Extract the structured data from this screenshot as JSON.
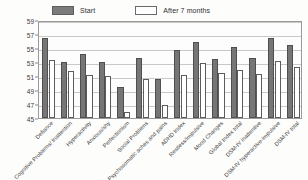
{
  "legend": {
    "position": "top-left",
    "items": [
      {
        "label": "Start",
        "swatch": "start",
        "color": "#767676"
      },
      {
        "label": "After 7 months",
        "swatch": "after",
        "color": "#ffffff"
      }
    ]
  },
  "chart_data": {
    "type": "bar",
    "title": "",
    "subtitle": "",
    "xlabel": "",
    "ylabel": "",
    "ylim": [
      45,
      59
    ],
    "yticks": [
      45,
      47,
      49,
      51,
      53,
      55,
      57,
      59
    ],
    "grid": true,
    "legend_position": "top-left",
    "categories": [
      "Defiance",
      "Cognitive Problems/ Inattention",
      "Hyperactivity",
      "Anxious/shy",
      "Perfectionism",
      "Social Problems",
      "Psychosomatic aches and pains",
      "ADHD Index",
      "Restless/impulsive",
      "Mood Changes",
      "Global Index total",
      "DSM-IV inattentive",
      "DSM-IV hyperactive-impulsive",
      "DSM-IV total"
    ],
    "series": [
      {
        "name": "Start",
        "color": "#767676",
        "values": [
          56.5,
          53.0,
          54.2,
          53.0,
          49.5,
          53.6,
          50.6,
          54.7,
          55.8,
          53.4,
          55.2,
          53.6,
          56.4,
          55.4
        ]
      },
      {
        "name": "After 7 months",
        "color": "#ffffff",
        "values": [
          53.3,
          51.7,
          51.1,
          51.0,
          45.8,
          50.6,
          46.8,
          51.1,
          52.9,
          51.4,
          51.9,
          51.3,
          53.2,
          52.3
        ]
      }
    ]
  }
}
